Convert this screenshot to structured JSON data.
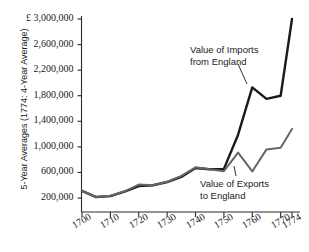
{
  "chart_data": {
    "type": "line",
    "title": "",
    "xlabel": "",
    "ylabel": "5-Year Averages (1774: 4-Year Average)",
    "currency_symbol": "£",
    "xlim": [
      1698,
      1776
    ],
    "ylim": [
      0,
      3000000
    ],
    "grid": false,
    "legend_position": "inline-annotations",
    "y_ticks": [
      3000000,
      2600000,
      2200000,
      1800000,
      1400000,
      1000000,
      600000,
      200000
    ],
    "y_tick_labels": [
      "£ 3,000,000",
      "2,600,000",
      "2,200,000",
      "1,800,000",
      "1,400,000",
      "1,000,000",
      "600,000",
      "200,000"
    ],
    "x_ticks": [
      1700,
      1710,
      1720,
      1730,
      1740,
      1750,
      1760,
      1770,
      1774
    ],
    "x_tick_labels": [
      "1700",
      "1710",
      "1720",
      "1730",
      "1740",
      "1750",
      "1760",
      "1770",
      "1774"
    ],
    "series": [
      {
        "name": "Value of Imports from England",
        "color": "#1a1a1a",
        "x": [
          1700,
          1705,
          1710,
          1715,
          1720,
          1725,
          1730,
          1735,
          1740,
          1745,
          1750,
          1755,
          1760,
          1765,
          1770,
          1774
        ],
        "values": [
          310000,
          215000,
          230000,
          300000,
          385000,
          400000,
          450000,
          530000,
          670000,
          650000,
          655000,
          1190000,
          1930000,
          1750000,
          1800000,
          3000000
        ]
      },
      {
        "name": "Value of Exports to England",
        "color": "#666666",
        "x": [
          1700,
          1705,
          1710,
          1715,
          1720,
          1725,
          1730,
          1735,
          1740,
          1745,
          1750,
          1755,
          1760,
          1765,
          1770,
          1774
        ],
        "values": [
          310000,
          215000,
          235000,
          305000,
          410000,
          400000,
          455000,
          545000,
          680000,
          650000,
          620000,
          910000,
          615000,
          960000,
          985000,
          1280000
        ]
      }
    ],
    "annotations": [
      {
        "text_lines": [
          "Value of Imports",
          "from England"
        ],
        "target_series": "Value of Imports from England",
        "target_x": 1760
      },
      {
        "text_lines": [
          "Value of Exports",
          "to England"
        ],
        "target_series": "Value of Exports to England",
        "target_x": 1760
      }
    ]
  }
}
